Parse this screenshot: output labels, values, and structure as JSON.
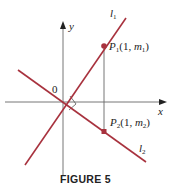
{
  "figure": {
    "caption": "FIGURE 5",
    "axes": {
      "x_label": "x",
      "y_label": "y",
      "origin_label": "0"
    },
    "lines": [
      {
        "name": "l",
        "subscript": "1",
        "color": "#a8323e"
      },
      {
        "name": "l",
        "subscript": "2",
        "color": "#a8323e"
      }
    ],
    "points": [
      {
        "name": "P",
        "subscript": "1",
        "coords_prefix": "(1, ",
        "m": "m",
        "m_sub": "1",
        "coords_suffix": ")"
      },
      {
        "name": "P",
        "subscript": "2",
        "coords_prefix": "(1, ",
        "m": "m",
        "m_sub": "2",
        "coords_suffix": ")"
      }
    ],
    "colors": {
      "line": "#a8323e",
      "axis": "#555555",
      "point": "#a8323e"
    }
  }
}
